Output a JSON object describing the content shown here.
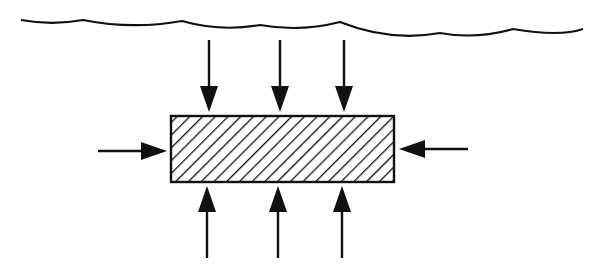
{
  "diagram": {
    "colors": {
      "stroke": "#111111",
      "background": "#ffffff"
    },
    "water_surface": {
      "points": [
        [
          21,
          20
        ],
        [
          83,
          20
        ],
        [
          182,
          21
        ],
        [
          260,
          25
        ],
        [
          340,
          22
        ],
        [
          440,
          33
        ],
        [
          513,
          29
        ]
      ]
    },
    "body": {
      "x": 171,
      "y": 116,
      "width": 223,
      "height": 66,
      "fill": "hatched"
    },
    "arrows": {
      "top": [
        {
          "x": 209,
          "y1": 40,
          "y2": 112
        },
        {
          "x": 280,
          "y1": 40,
          "y2": 112
        },
        {
          "x": 344,
          "y1": 40,
          "y2": 112
        }
      ],
      "bottom": [
        {
          "x": 207,
          "y1": 258,
          "y2": 186
        },
        {
          "x": 278,
          "y1": 258,
          "y2": 186
        },
        {
          "x": 342,
          "y1": 258,
          "y2": 186
        }
      ],
      "left": {
        "y": 151,
        "x1": 98,
        "x2": 167
      },
      "right": {
        "y": 149,
        "x1": 468,
        "x2": 399
      }
    }
  }
}
